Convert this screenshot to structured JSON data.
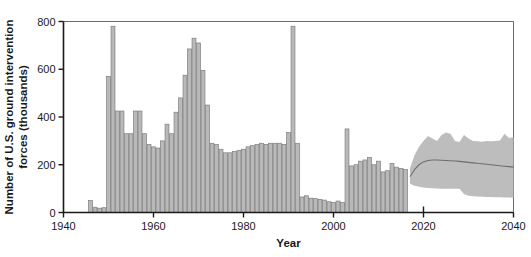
{
  "chart_data": {
    "type": "bar",
    "title": "",
    "xlabel": "Year",
    "ylabel": "Number of U.S. ground intervention forces (thousands)",
    "xlim": [
      1940,
      2040
    ],
    "ylim": [
      0,
      800
    ],
    "xticks": [
      1940,
      1960,
      1980,
      2000,
      2020,
      2040
    ],
    "xticklabels": [
      "1940",
      "1960",
      "1980",
      "2000",
      "2020",
      "2040"
    ],
    "yticks": [
      0,
      200,
      400,
      600,
      800
    ],
    "yticklabels": [
      "0",
      "200",
      "400",
      "600",
      "800"
    ],
    "grid": false,
    "legend": null,
    "bar_color": "#b9b9b9",
    "bar_edge_color": "#7d7d7d",
    "band_color": "#bdbdbd",
    "median_color": "#6e6e6e",
    "historical": {
      "name": "U.S. ground intervention forces",
      "x": [
        1946,
        1947,
        1948,
        1949,
        1950,
        1951,
        1952,
        1953,
        1954,
        1955,
        1956,
        1957,
        1958,
        1959,
        1960,
        1961,
        1962,
        1963,
        1964,
        1965,
        1966,
        1967,
        1968,
        1969,
        1970,
        1971,
        1972,
        1973,
        1974,
        1975,
        1976,
        1977,
        1978,
        1979,
        1980,
        1981,
        1982,
        1983,
        1984,
        1985,
        1986,
        1987,
        1988,
        1989,
        1990,
        1991,
        1992,
        1993,
        1994,
        1995,
        1996,
        1997,
        1998,
        1999,
        2000,
        2001,
        2002,
        2003,
        2004,
        2005,
        2006,
        2007,
        2008,
        2009,
        2010,
        2011,
        2012,
        2013,
        2014,
        2015,
        2016
      ],
      "values": [
        50,
        22,
        18,
        20,
        570,
        780,
        425,
        425,
        330,
        330,
        425,
        425,
        330,
        285,
        275,
        270,
        300,
        370,
        330,
        420,
        480,
        575,
        685,
        730,
        710,
        595,
        450,
        290,
        285,
        265,
        250,
        250,
        255,
        260,
        265,
        275,
        280,
        285,
        290,
        285,
        290,
        290,
        290,
        285,
        335,
        780,
        290,
        65,
        70,
        60,
        58,
        55,
        52,
        45,
        42,
        48,
        42,
        350,
        195,
        200,
        215,
        220,
        230,
        200,
        215,
        170,
        175,
        205,
        190,
        185,
        180
      ]
    },
    "forecast": {
      "name": "Projected range",
      "start_year": 2017,
      "end_year": 2040,
      "x": [
        2017,
        2018,
        2019,
        2020,
        2021,
        2022,
        2023,
        2024,
        2025,
        2026,
        2027,
        2028,
        2029,
        2030,
        2031,
        2032,
        2033,
        2034,
        2035,
        2036,
        2037,
        2038,
        2039,
        2040
      ],
      "upper": [
        185,
        240,
        275,
        300,
        320,
        310,
        300,
        325,
        335,
        330,
        300,
        295,
        325,
        310,
        300,
        298,
        296,
        300,
        298,
        300,
        302,
        330,
        312,
        315
      ],
      "median": [
        150,
        180,
        200,
        212,
        218,
        220,
        220,
        219,
        218,
        217,
        216,
        214,
        212,
        210,
        208,
        206,
        204,
        202,
        200,
        198,
        196,
        194,
        192,
        190
      ],
      "lower": [
        120,
        112,
        108,
        105,
        103,
        102,
        101,
        100,
        100,
        100,
        100,
        100,
        78,
        70,
        68,
        67,
        66,
        65,
        65,
        64,
        64,
        63,
        63,
        62
      ]
    }
  }
}
